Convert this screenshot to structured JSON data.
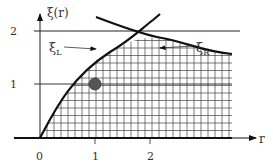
{
  "diagram": {
    "y_axis_label": "ξ(r)",
    "x_axis_label": "r",
    "x_ticks": [
      "0",
      "1",
      "2"
    ],
    "y_ticks": [
      "1",
      "2"
    ],
    "curve_left_label": "ξ",
    "curve_left_sub": "L",
    "curve_right_label": "ξ",
    "curve_right_sub": "R",
    "colors": {
      "line": "#111111",
      "grid": "#444444",
      "dot": "#555555",
      "text": "#333333"
    }
  }
}
